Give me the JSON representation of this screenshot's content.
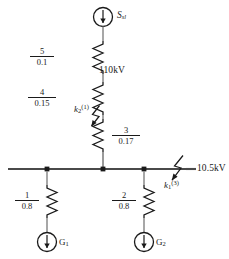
{
  "diagram": {
    "type": "power-system-single-line-diagram",
    "title": "",
    "line_color": "#1a1a1a",
    "background": "#ffffff"
  },
  "source": {
    "name": "source-S",
    "symbol": "circle-with-down-arrow",
    "label_main": "S",
    "label_sub": "sl"
  },
  "voltages": {
    "hv": "110kV",
    "lv": "10.5kV"
  },
  "branches": {
    "hv_chain": [
      {
        "name": "impedance-5",
        "numerator": "5",
        "denominator": "0.1"
      },
      {
        "name": "impedance-4",
        "numerator": "4",
        "denominator": "0.15"
      },
      {
        "name": "impedance-3",
        "numerator": "3",
        "denominator": "0.17"
      }
    ],
    "generators": [
      {
        "name": "generator-branch-1",
        "numerator": "1",
        "denominator": "0.8",
        "gen_label": "G",
        "gen_sub": "1",
        "symbol": "circle-with-down-arrow"
      },
      {
        "name": "generator-branch-2",
        "numerator": "2",
        "denominator": "0.8",
        "gen_label": "G",
        "gen_sub": "2",
        "symbol": "circle-with-down-arrow"
      }
    ]
  },
  "faults": [
    {
      "name": "fault-k2",
      "label_main": "k",
      "label_sub": "2",
      "label_sup": "(1)",
      "symbol": "lightning-arrow",
      "location": "hv-line-between-impedance-4-and-3"
    },
    {
      "name": "fault-k1",
      "label_main": "k",
      "label_sub": "1",
      "label_sup": "(3)",
      "symbol": "lightning-arrow",
      "location": "lv-busbar-right-end"
    }
  ],
  "busbar": {
    "name": "busbar-10.5kV",
    "node_count": 3
  }
}
